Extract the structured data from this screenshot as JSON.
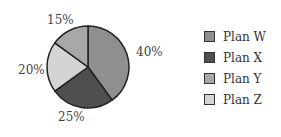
{
  "chart_data": {
    "type": "pie",
    "title": "",
    "categories": [
      "Plan W",
      "Plan X",
      "Plan Y",
      "Plan Z"
    ],
    "values": [
      40,
      25,
      15,
      20
    ],
    "slice_order_clockwise_from_top": [
      "Plan W",
      "Plan X",
      "Plan Z",
      "Plan Y"
    ],
    "labels": [
      "40%",
      "25%",
      "15%",
      "20%"
    ],
    "colors": {
      "Plan W": "#8f8f8f",
      "Plan X": "#4f4f4f",
      "Plan Y": "#a8a8a8",
      "Plan Z": "#d4d4d4"
    },
    "legend_position": "right"
  },
  "legend": {
    "items": [
      {
        "label": "Plan W",
        "color": "#8f8f8f"
      },
      {
        "label": "Plan X",
        "color": "#4f4f4f"
      },
      {
        "label": "Plan Y",
        "color": "#a8a8a8"
      },
      {
        "label": "Plan Z",
        "color": "#d4d4d4"
      }
    ]
  },
  "slice_labels": {
    "w": "40%",
    "x": "25%",
    "z": "20%",
    "y": "15%"
  }
}
